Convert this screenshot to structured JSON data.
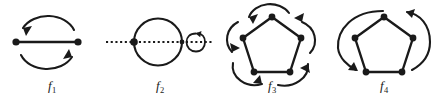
{
  "figure": {
    "type": "diagram",
    "stroke_color": "#1a1a1a",
    "background_color": "#ffffff",
    "panels": [
      {
        "id": "f1",
        "label": "f",
        "subscript": "1",
        "graph": "two vertices joined by a single horizontal edge",
        "vertex_count": 2,
        "vertices": [
          {
            "x": 16,
            "y": 42
          },
          {
            "x": 78,
            "y": 42
          }
        ],
        "edges": [
          [
            0,
            1
          ]
        ],
        "arcs": [
          {
            "name": "top-arc",
            "direction": "right-to-left",
            "arrowhead": "left-end",
            "side": "above"
          },
          {
            "name": "bottom-arc",
            "direction": "left-to-right",
            "arrowhead": "right-end",
            "side": "below"
          }
        ],
        "meaning": "transposition: the two vertices are swapped"
      },
      {
        "id": "f2",
        "label": "f",
        "subscript": "2",
        "graph": "two vertices joined by two parallel edges forming a circle",
        "vertex_count": 2,
        "vertices": [
          {
            "x": 30,
            "y": 42
          },
          {
            "x": 78,
            "y": 42
          }
        ],
        "edges": [
          [
            0,
            1
          ],
          [
            0,
            1
          ]
        ],
        "axis": {
          "name": "dotted-axis",
          "style": "dotted",
          "orientation": "horizontal",
          "x_start": 2,
          "x_end": 110,
          "y": 42
        },
        "rotation_indicator": {
          "name": "rotation-ellipse",
          "position": "right-of-circle",
          "arrowhead": "top-left",
          "axis": "horizontal"
        },
        "meaning": "rotation about the horizontal axis: the two parallel edges are swapped, vertices fixed"
      },
      {
        "id": "f3",
        "label": "f",
        "subscript": "3",
        "graph": "5-cycle drawn as a regular pentagon",
        "vertex_count": 5,
        "vertices": [
          {
            "x": 56,
            "y": 17
          },
          {
            "x": 27,
            "y": 38
          },
          {
            "x": 38,
            "y": 72
          },
          {
            "x": 74,
            "y": 72
          },
          {
            "x": 85,
            "y": 38
          }
        ],
        "edges": [
          [
            0,
            1
          ],
          [
            1,
            2
          ],
          [
            2,
            3
          ],
          [
            3,
            4
          ],
          [
            4,
            0
          ]
        ],
        "arcs": [
          {
            "name": "arc-top-to-upper-left",
            "from": 0,
            "to": 1,
            "arrowhead": "at-target"
          },
          {
            "name": "arc-upper-left-to-lower-left",
            "from": 1,
            "to": 2,
            "arrowhead": "at-target"
          },
          {
            "name": "arc-lower-left-to-lower-right",
            "from": 2,
            "to": 3,
            "arrowhead": "at-target"
          },
          {
            "name": "arc-lower-right-to-upper-right",
            "from": 3,
            "to": 4,
            "arrowhead": "at-target"
          },
          {
            "name": "arc-upper-right-to-top",
            "from": 4,
            "to": 0,
            "arrowhead": "at-target"
          }
        ],
        "arc_count": 5,
        "meaning": "rotation by one fifth turn: every vertex moves to the next vertex counterclockwise"
      },
      {
        "id": "f4",
        "label": "f",
        "subscript": "4",
        "graph": "5-cycle drawn as a regular pentagon",
        "vertex_count": 5,
        "vertices": [
          {
            "x": 56,
            "y": 17
          },
          {
            "x": 27,
            "y": 38
          },
          {
            "x": 38,
            "y": 72
          },
          {
            "x": 74,
            "y": 72
          },
          {
            "x": 85,
            "y": 38
          }
        ],
        "edges": [
          [
            0,
            1
          ],
          [
            1,
            2
          ],
          [
            2,
            3
          ],
          [
            3,
            4
          ],
          [
            4,
            0
          ]
        ],
        "arcs": [
          {
            "name": "arc-left-outer",
            "from": 1,
            "to": 2,
            "arrowhead": "at-target",
            "side": "left"
          },
          {
            "name": "arc-right-outer",
            "from": 4,
            "to": 0,
            "arrowhead": "at-target",
            "side": "right-over-top"
          }
        ],
        "arc_count": 2,
        "meaning": "reflection: pairs of vertices are exchanged across the vertical axis"
      }
    ]
  }
}
